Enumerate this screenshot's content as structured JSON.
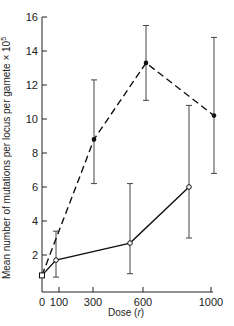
{
  "chart_data": {
    "type": "line",
    "title": "",
    "xlabel": "Dose (r)",
    "ylabel": "Mean number of mutations per locus per gamete × 10^5",
    "ylabel_parts": {
      "main": "Mean number of mutations per locus per gamete × 10",
      "sup": "5"
    },
    "x_ticks": [
      0,
      100,
      300,
      600,
      1000
    ],
    "x_tick_px": [
      42,
      59,
      93,
      143,
      211
    ],
    "y_ticks": [
      2,
      4,
      6,
      8,
      10,
      12,
      14,
      16
    ],
    "ylim": [
      0,
      16
    ],
    "grid": false,
    "legend": null,
    "series": [
      {
        "name": "dashed (filled circles)",
        "style": "dashed",
        "marker": "filled-circle",
        "points": [
          {
            "x": 0,
            "xpx": 42,
            "y": 0.8,
            "err_low": null,
            "err_high": null
          },
          {
            "x": 300,
            "xpx": 94,
            "y": 8.8,
            "err_low": 6.2,
            "err_high": 12.3
          },
          {
            "x": 600,
            "xpx": 146,
            "y": 13.3,
            "err_low": 11.1,
            "err_high": 15.5
          },
          {
            "x": 1000,
            "xpx": 214,
            "y": 10.2,
            "err_low": 6.8,
            "err_high": 14.8
          }
        ]
      },
      {
        "name": "solid (open circles)",
        "style": "solid",
        "marker": "open-circle",
        "points": [
          {
            "x": 0,
            "xpx": 42,
            "y": 0.8,
            "err_low": null,
            "err_high": null
          },
          {
            "x": 100,
            "xpx": 56,
            "y": 1.7,
            "err_low": 0.7,
            "err_high": 3.4
          },
          {
            "x": 500,
            "xpx": 130,
            "y": 2.7,
            "err_low": 0.9,
            "err_high": 6.2
          },
          {
            "x": 900,
            "xpx": 189,
            "y": 6.0,
            "err_low": 3.0,
            "err_high": 10.8
          }
        ]
      }
    ]
  }
}
